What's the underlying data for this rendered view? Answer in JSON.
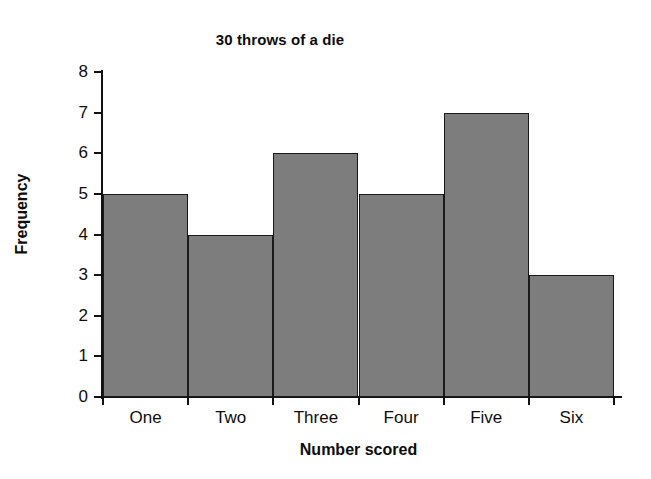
{
  "chart_data": {
    "type": "bar",
    "title": "30 throws of a die",
    "xlabel": "Number scored",
    "ylabel": "Frequency",
    "categories": [
      "One",
      "Two",
      "Three",
      "Four",
      "Five",
      "Six"
    ],
    "values": [
      5,
      4,
      6,
      5,
      7,
      3
    ],
    "ylim": [
      0,
      8
    ],
    "ytick_labels": [
      "8",
      "7",
      "6",
      "5",
      "4",
      "3",
      "2",
      "1",
      "0"
    ],
    "ytick_values": [
      8,
      7,
      6,
      5,
      4,
      3,
      2,
      1,
      0
    ],
    "ytick_step": 1,
    "grid": false,
    "legend": false,
    "legend_position": "none",
    "bar_fill_color": "#7d7d7d",
    "bar_edge_color": "#1a1a1a",
    "axis_color": "#111111",
    "background_color": "#ffffff",
    "total": 30
  }
}
